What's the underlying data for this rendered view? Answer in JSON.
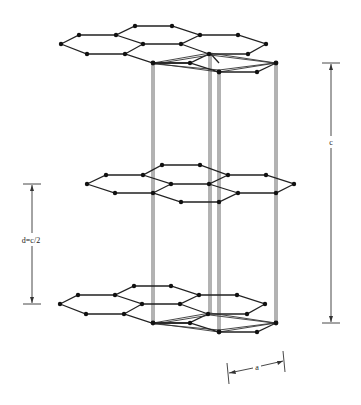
{
  "figure": {
    "labels": {
      "c_axis": "c",
      "interlayer": "d=c/2",
      "lattice_a": "a"
    },
    "colors": {
      "ink": "#222222",
      "background": "#ffffff"
    }
  },
  "layers": [
    {
      "name": "top-layer",
      "offset_y": 0,
      "shift_x": 0
    },
    {
      "name": "middle-layer",
      "offset_y": 130,
      "shift_x": 26
    },
    {
      "name": "bottom-layer",
      "offset_y": 260,
      "shift_x": 0
    }
  ]
}
